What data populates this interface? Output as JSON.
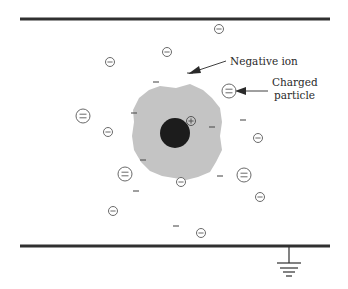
{
  "diagram": {
    "colors": {
      "plate": "#303030",
      "blob": "#c4c4c4",
      "core": "#1c1c1c",
      "ion_stroke": "#6a6a6a",
      "text": "#2a2a2a"
    },
    "plates": {
      "top": {
        "x1": 20,
        "x2": 330,
        "y": 19
      },
      "bottom": {
        "x1": 20,
        "x2": 330,
        "y": 246
      }
    },
    "ground": {
      "x": 289,
      "label": "ground-symbol"
    },
    "labels": {
      "negative_ion": "Negative ion",
      "charged_particle_line1": "Charged",
      "charged_particle_line2": "particle"
    },
    "negative_ions": [
      {
        "x": 219,
        "y": 29
      },
      {
        "x": 167,
        "y": 52
      },
      {
        "x": 110,
        "y": 62
      },
      {
        "x": 108,
        "y": 132
      },
      {
        "x": 258,
        "y": 138
      },
      {
        "x": 181,
        "y": 182
      },
      {
        "x": 260,
        "y": 197
      },
      {
        "x": 113,
        "y": 211
      },
      {
        "x": 201,
        "y": 233
      }
    ],
    "charged_particles": [
      {
        "x": 229,
        "y": 91
      },
      {
        "x": 83,
        "y": 116
      },
      {
        "x": 125,
        "y": 174
      },
      {
        "x": 244,
        "y": 175
      }
    ],
    "free_electrons": [
      {
        "x": 156,
        "y": 82
      },
      {
        "x": 190,
        "y": 73
      },
      {
        "x": 134,
        "y": 113
      },
      {
        "x": 243,
        "y": 120
      },
      {
        "x": 212,
        "y": 127
      },
      {
        "x": 143,
        "y": 160
      },
      {
        "x": 220,
        "y": 176
      },
      {
        "x": 136,
        "y": 191
      },
      {
        "x": 176,
        "y": 226
      }
    ],
    "positive_ion": {
      "x": 191,
      "y": 121,
      "symbol": "+"
    },
    "core": {
      "x": 175,
      "y": 133,
      "r": 15
    }
  }
}
